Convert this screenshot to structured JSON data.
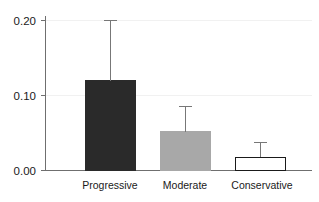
{
  "chart_data": {
    "type": "bar",
    "title": "",
    "subtitle": "",
    "xlabel": "",
    "ylabel": "",
    "categories": [
      "Progressive",
      "Moderate",
      "Conservative"
    ],
    "values": [
      0.12,
      0.052,
      0.018
    ],
    "errors_upper": [
      0.2,
      0.085,
      0.037
    ],
    "bar_colors": [
      "#2a2a2a",
      "#a8a8a8",
      "#ffffff"
    ],
    "bar_edge_colors": [
      "#2a2a2a",
      "#a8a8a8",
      "#1a1a1a"
    ],
    "ylim": [
      0.0,
      0.215
    ],
    "ytick_labels": [
      "0.00",
      "0.10",
      "0.20"
    ],
    "ytick_values": [
      0.0,
      0.1,
      0.2
    ],
    "grid": true,
    "grid_color": "#f1f1f1",
    "legend": "none",
    "error_bar_style": "upper-only-with-cap",
    "error_bar_color": "#777777",
    "axis_color": "#6f6f6f",
    "background_color": "#ffffff"
  },
  "axis": {
    "y_tick_0": "0.00",
    "y_tick_1": "0.10",
    "y_tick_2": "0.20"
  },
  "categories": {
    "cat_0": "Progressive",
    "cat_1": "Moderate",
    "cat_2": "Conservative"
  }
}
